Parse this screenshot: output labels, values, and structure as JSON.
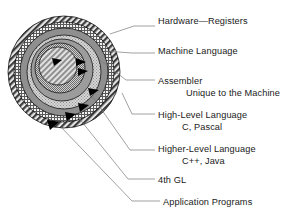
{
  "diagram": {
    "type": "concentric-layers",
    "center": {
      "x": 64,
      "y": 72
    },
    "layers": [
      {
        "id": "hardware",
        "name": "Hardware—Registers",
        "radius": 22,
        "pattern": "diagonal-hatch-light",
        "fill": "#d8d8d8"
      },
      {
        "id": "machine",
        "name": "Machine Language",
        "radius": 31,
        "pattern": "dense-dot",
        "fill": "#bfbfbf"
      },
      {
        "id": "assembler",
        "name": "Assembler",
        "radius": 38,
        "pattern": "solid-gray",
        "fill": "#9a9a9a"
      },
      {
        "id": "high-level",
        "name": "High-Level Language",
        "radius": 46,
        "pattern": "stipple",
        "fill": "#cbcbcb"
      },
      {
        "id": "higher-level",
        "name": "Higher-Level Language",
        "radius": 53,
        "pattern": "solid-mid-gray",
        "fill": "#8e8e8e"
      },
      {
        "id": "fourth-gl",
        "name": "4th GL",
        "radius": 60,
        "pattern": "cross-hatch",
        "fill": "#e6e6e6"
      },
      {
        "id": "applications",
        "name": "Application Programs",
        "radius": 66,
        "pattern": "diagonal-hatch-dark",
        "fill": "#c4c4c4"
      }
    ],
    "colors": {
      "stroke": "#000000",
      "leader_line": "#777777",
      "text": "#1a1a1a",
      "background": "#ffffff"
    }
  },
  "labels": [
    {
      "id": "hardware",
      "text": "Hardware—Registers",
      "sub": ""
    },
    {
      "id": "machine",
      "text": "Machine Language",
      "sub": ""
    },
    {
      "id": "assembler",
      "text": "Assembler",
      "sub": "Unique to the Machine"
    },
    {
      "id": "high-level",
      "text": "High-Level Language",
      "sub": "C, Pascal"
    },
    {
      "id": "higher-level",
      "text": "Higher-Level Language",
      "sub": "C++, Java"
    },
    {
      "id": "fourth-gl",
      "text": "4th GL",
      "sub": ""
    },
    {
      "id": "applications",
      "text": "Application Programs",
      "sub": ""
    }
  ]
}
